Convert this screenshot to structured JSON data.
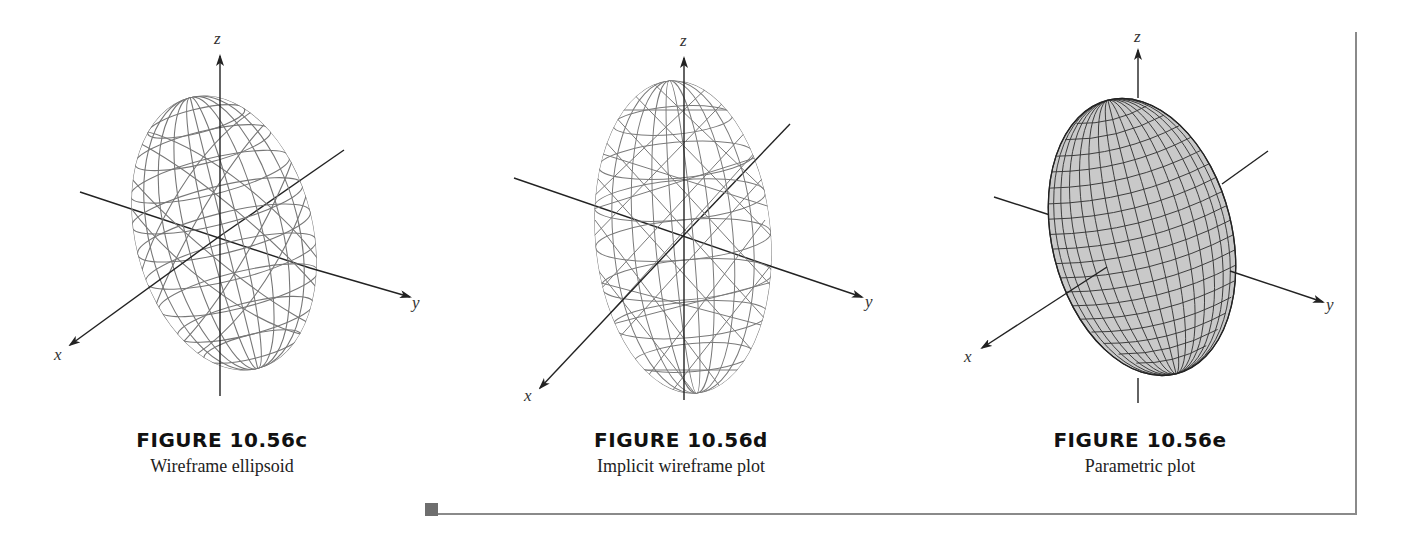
{
  "figures": [
    {
      "id": "c",
      "number": "FIGURE 10.56c",
      "description": "Wireframe ellipsoid",
      "axes": {
        "x": "x",
        "y": "y",
        "z": "z"
      }
    },
    {
      "id": "d",
      "number": "FIGURE 10.56d",
      "description": "Implicit wireframe plot",
      "axes": {
        "x": "x",
        "y": "y",
        "z": "z"
      }
    },
    {
      "id": "e",
      "number": "FIGURE 10.56e",
      "description": "Parametric plot",
      "axes": {
        "x": "x",
        "y": "y",
        "z": "z"
      }
    }
  ],
  "colors": {
    "axis": "#222222",
    "wireframe": "#777777",
    "surface_fill": "#c8c8c8",
    "frame": "#8a8a8a"
  }
}
